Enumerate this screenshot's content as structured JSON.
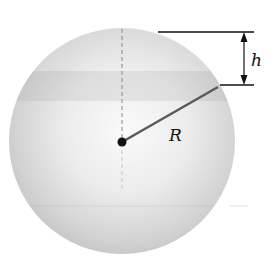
{
  "diagram": {
    "type": "sphere-cap",
    "labels": {
      "height": "h",
      "radius": "R"
    },
    "colors": {
      "sphere_light": "#f6f6f6",
      "sphere_dark": "#b8b8b8",
      "band": "#d0d0d0",
      "line": "#111111",
      "radius_line": "#555555"
    }
  }
}
